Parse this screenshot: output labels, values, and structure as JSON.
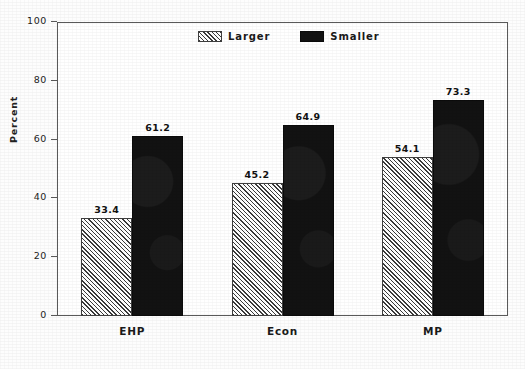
{
  "chart_data": {
    "type": "bar",
    "title": "",
    "subtitle": "",
    "xlabel": "",
    "ylabel": "Percent",
    "categories": [
      "EHP",
      "Econ",
      "MP"
    ],
    "series": [
      {
        "name": "Larger",
        "values": [
          33.4,
          45.2,
          54.1
        ],
        "fill": "diagonal-hatch",
        "color": "#ffffff"
      },
      {
        "name": "Smaller",
        "values": [
          61.2,
          64.9,
          73.3
        ],
        "fill": "solid",
        "color": "#121212"
      }
    ],
    "ylim": [
      0,
      100
    ],
    "yticks": [
      0,
      20,
      40,
      60,
      80,
      100
    ],
    "ytick_labels": [
      "0",
      "20",
      "40",
      "60",
      "80",
      "100"
    ],
    "grid": false,
    "legend_position": "top-center",
    "value_labels": true
  },
  "legend": {
    "items": [
      {
        "label": "Larger"
      },
      {
        "label": "Smaller"
      }
    ]
  },
  "axis": {
    "y_title": "Percent"
  }
}
